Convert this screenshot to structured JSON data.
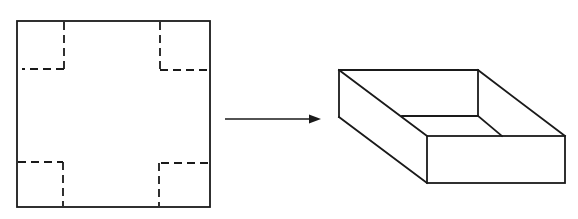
{
  "diagram": {
    "type": "folding-net-to-box",
    "description": "A square sheet with dashed fold/cut lines marking square notches at each corner; an arrow points to the resulting open-top rectangular box",
    "net": {
      "label": "flat square sheet with corner cut-outs",
      "outline": {
        "x1": 17,
        "y1": 21,
        "x2": 210,
        "y2": 207
      },
      "corner_cuts": [
        {
          "name": "top-left",
          "corner_x": 64,
          "corner_y": 69
        },
        {
          "name": "top-right",
          "corner_x": 160,
          "corner_y": 70
        },
        {
          "name": "bottom-left",
          "corner_x": 63,
          "corner_y": 162
        },
        {
          "name": "bottom-right",
          "corner_x": 159,
          "corner_y": 163
        }
      ],
      "line_style": "dashed"
    },
    "arrow": {
      "label": "transformation arrow",
      "from": {
        "x": 225,
        "y": 119
      },
      "to": {
        "x": 321,
        "y": 119
      },
      "direction": "right"
    },
    "box": {
      "label": "open-top box (3D)",
      "vertices": {
        "back_top_left": [
          339,
          70
        ],
        "back_top_right": [
          478,
          70
        ],
        "front_top_left": [
          427,
          136
        ],
        "front_top_right": [
          565,
          136
        ],
        "left_bottom_back": [
          339,
          117
        ],
        "front_bottom_left": [
          427,
          183
        ],
        "front_bottom_right": [
          565,
          183
        ],
        "inner_back_left": [
          402,
          116
        ],
        "inner_back_right": [
          478,
          116
        ],
        "inner_front_meet": [
          502,
          136
        ]
      }
    },
    "colors": {
      "stroke": "#1a1a1a",
      "background": "#ffffff"
    }
  }
}
